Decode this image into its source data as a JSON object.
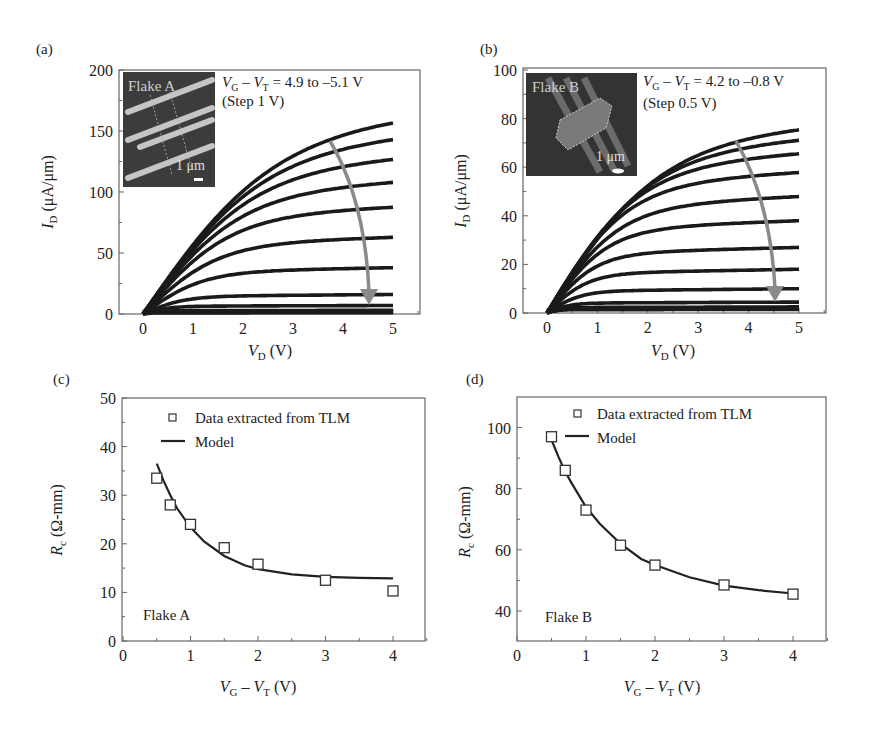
{
  "chart_data": [
    {
      "panel": "(a)",
      "type": "line",
      "title": "",
      "xlabel": "V_D (V)",
      "ylabel": "I_D (μA/μm)",
      "xlim": [
        -0.5,
        5.5
      ],
      "ylim": [
        0,
        200
      ],
      "xticks": [
        0,
        1,
        2,
        3,
        4,
        5
      ],
      "yticks": [
        0,
        50,
        100,
        150,
        200
      ],
      "grid": false,
      "annotation": [
        "V_G − V_T = 4.9 to −5.1 V",
        "(Step 1 V)"
      ],
      "inset": {
        "label": "Flake A",
        "scale_bar": "1 μm"
      },
      "arrow": "gray curved arrow pointing downward, decreasing gate voltage",
      "series_end_values_at_VD5": [
        163,
        147,
        129,
        109,
        88,
        63,
        38,
        16,
        7,
        3,
        1
      ],
      "series_saturation_knee_VD": [
        3.5,
        3.2,
        2.9,
        2.6,
        2.3,
        2.0,
        1.6,
        1.1,
        0.7,
        0.4,
        0.2
      ]
    },
    {
      "panel": "(b)",
      "type": "line",
      "title": "",
      "xlabel": "V_D (V)",
      "ylabel": "I_D (μA/μm)",
      "xlim": [
        -0.5,
        5.5
      ],
      "ylim": [
        0,
        100
      ],
      "xticks": [
        0,
        1,
        2,
        3,
        4,
        5
      ],
      "yticks": [
        0,
        20,
        40,
        60,
        80,
        100
      ],
      "grid": false,
      "annotation": [
        "V_G − V_T = 4.2 to −0.8 V",
        "(Step 0.5 V)"
      ],
      "inset": {
        "label": "Flake B",
        "scale_bar": "1 μm"
      },
      "arrow": "gray curved arrow pointing downward, decreasing gate voltage",
      "series_end_values_at_VD5": [
        77,
        72,
        66,
        58,
        48,
        38,
        27,
        18,
        10,
        4.5,
        2.5,
        1.5
      ],
      "series_saturation_knee_VD": [
        3.0,
        2.7,
        2.4,
        2.1,
        1.9,
        1.6,
        1.3,
        1.1,
        0.9,
        0.6,
        0.4,
        0.3
      ]
    },
    {
      "panel": "(c)",
      "type": "scatter",
      "title": "",
      "xlabel": "V_G − V_T (V)",
      "ylabel": "R_c (Ω-mm)",
      "xlim": [
        0,
        4.5
      ],
      "ylim": [
        0,
        50
      ],
      "xticks": [
        0,
        1,
        2,
        3,
        4
      ],
      "yticks": [
        0,
        10,
        20,
        30,
        40,
        50
      ],
      "grid": false,
      "legend": [
        "Data extracted from TLM",
        "Model"
      ],
      "legend_position": "upper right",
      "annotation": "Flake A",
      "series": [
        {
          "name": "Data extracted from TLM",
          "marker": "square",
          "x": [
            0.5,
            0.7,
            1.0,
            1.5,
            2.0,
            3.0,
            4.0
          ],
          "y": [
            33.5,
            28.0,
            24.0,
            19.2,
            15.8,
            12.5,
            10.3
          ]
        },
        {
          "name": "Model",
          "style": "line",
          "x": [
            0.5,
            0.6,
            0.7,
            0.8,
            1.0,
            1.2,
            1.5,
            1.8,
            2.0,
            2.5,
            3.0,
            3.5,
            4.0
          ],
          "y": [
            36.5,
            33.0,
            30.0,
            27.3,
            23.4,
            20.5,
            17.5,
            15.6,
            14.8,
            13.7,
            13.2,
            13.0,
            12.9
          ]
        }
      ]
    },
    {
      "panel": "(d)",
      "type": "scatter",
      "title": "",
      "xlabel": "V_G − V_T (V)",
      "ylabel": "R_c (Ω-mm)",
      "xlim": [
        0,
        4.5
      ],
      "ylim": [
        30,
        110
      ],
      "xticks": [
        0,
        1,
        2,
        3,
        4
      ],
      "yticks": [
        40,
        60,
        80,
        100
      ],
      "grid": false,
      "legend": [
        "Data extracted from TLM",
        "Model"
      ],
      "legend_position": "upper right",
      "annotation": "Flake B",
      "series": [
        {
          "name": "Data extracted from TLM",
          "marker": "square",
          "x": [
            0.5,
            0.7,
            1.0,
            1.5,
            2.0,
            3.0,
            4.0
          ],
          "y": [
            97,
            86,
            73,
            61.5,
            55,
            48.5,
            45.5
          ]
        },
        {
          "name": "Model",
          "style": "line",
          "x": [
            0.5,
            0.6,
            0.7,
            0.8,
            1.0,
            1.2,
            1.5,
            1.8,
            2.0,
            2.5,
            3.0,
            3.5,
            4.0
          ],
          "y": [
            96,
            90.5,
            85.5,
            81.5,
            74,
            68.5,
            62,
            57,
            55,
            51,
            48.3,
            46.8,
            45.7
          ]
        }
      ]
    }
  ],
  "panels": {
    "a": {
      "letter": "(a)",
      "ylabel_main": "I",
      "ylabel_sub": "D",
      "ylabel_rest": " (μA/μm)",
      "xlabel_main": "V",
      "xlabel_sub": "D",
      "xlabel_rest": " (V)",
      "yticks": [
        "0",
        "50",
        "100",
        "150",
        "200"
      ],
      "xticks": [
        "0",
        "1",
        "2",
        "3",
        "4",
        "5"
      ],
      "anno1_a": "V",
      "anno1_asub": "G",
      "anno1_mid": " – ",
      "anno1_b": "V",
      "anno1_bsub": "T",
      "anno1_rest": " = 4.9 to –5.1 V",
      "anno2": "(Step 1 V)",
      "inset_label": "Flake A",
      "inset_scale": "1 μm"
    },
    "b": {
      "letter": "(b)",
      "ylabel_main": "I",
      "ylabel_sub": "D",
      "ylabel_rest": " (μA/μm)",
      "xlabel_main": "V",
      "xlabel_sub": "D",
      "xlabel_rest": " (V)",
      "yticks": [
        "0",
        "20",
        "40",
        "60",
        "80",
        "100"
      ],
      "xticks": [
        "0",
        "1",
        "2",
        "3",
        "4",
        "5"
      ],
      "anno1_a": "V",
      "anno1_asub": "G",
      "anno1_mid": " – ",
      "anno1_b": "V",
      "anno1_bsub": "T",
      "anno1_rest": " = 4.2 to –0.8 V",
      "anno2": "(Step 0.5 V)",
      "inset_label": "Flake B",
      "inset_scale": "1 μm"
    },
    "c": {
      "letter": "(c)",
      "ylabel_main": "R",
      "ylabel_sub": "c",
      "ylabel_rest": " (Ω-mm)",
      "xlabel_main": "V",
      "xlabel_sub": "G",
      "xlabel_mid": " – ",
      "xlabel_b": "V",
      "xlabel_bsub": "T",
      "xlabel_rest": " (V)",
      "yticks": [
        "0",
        "10",
        "20",
        "30",
        "40",
        "50"
      ],
      "xticks": [
        "0",
        "1",
        "2",
        "3",
        "4"
      ],
      "legend_data": "Data extracted from TLM",
      "legend_model": "Model",
      "flake": "Flake A"
    },
    "d": {
      "letter": "(d)",
      "ylabel_main": "R",
      "ylabel_sub": "c",
      "ylabel_rest": " (Ω-mm)",
      "xlabel_main": "V",
      "xlabel_sub": "G",
      "xlabel_mid": " – ",
      "xlabel_b": "V",
      "xlabel_bsub": "T",
      "xlabel_rest": " (V)",
      "yticks": [
        "40",
        "60",
        "80",
        "100"
      ],
      "xticks": [
        "0",
        "1",
        "2",
        "3",
        "4"
      ],
      "legend_data": "Data extracted from TLM",
      "legend_model": "Model",
      "flake": "Flake B"
    }
  },
  "colors": {
    "curve": "#1a1a1a",
    "arrow": "#8a8a8a",
    "axis": "#555555",
    "inset_bg": "#3c3c3c",
    "inset_stripe": "#d8d8d8"
  }
}
